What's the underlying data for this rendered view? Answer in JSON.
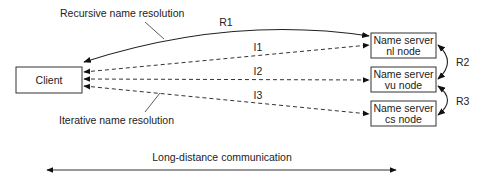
{
  "diagram": {
    "nodes": {
      "client": {
        "label": "Client"
      },
      "nl": {
        "line1": "Name server",
        "line2": "nl node"
      },
      "vu": {
        "line1": "Name server",
        "line2": "vu node"
      },
      "cs": {
        "line1": "Name server",
        "line2": "cs node"
      }
    },
    "edges": {
      "r1": {
        "label": "R1",
        "style": "solid",
        "from": "client",
        "to": "nl"
      },
      "r2": {
        "label": "R2",
        "style": "solid",
        "from": "nl",
        "to": "vu"
      },
      "r3": {
        "label": "R3",
        "style": "solid",
        "from": "vu",
        "to": "cs"
      },
      "i1": {
        "label": "I1",
        "style": "dashed",
        "from": "client",
        "to": "nl"
      },
      "i2": {
        "label": "I2",
        "style": "dashed",
        "from": "client",
        "to": "vu"
      },
      "i3": {
        "label": "I3",
        "style": "dashed",
        "from": "client",
        "to": "cs"
      }
    },
    "annotations": {
      "recursive": "Recursive name resolution",
      "iterative": "Iterative name resolution",
      "long_distance": "Long-distance communication"
    },
    "colors": {
      "stroke": "#222222",
      "background": "#ffffff"
    }
  }
}
